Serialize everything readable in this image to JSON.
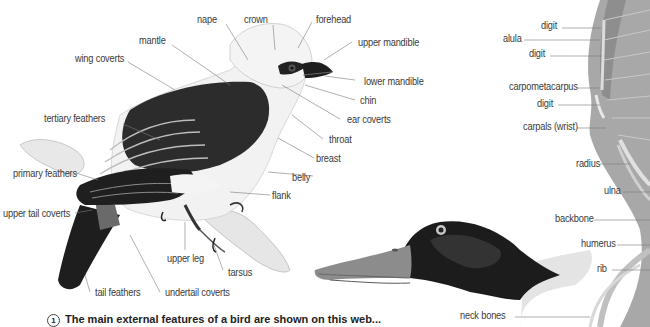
{
  "bird_external": {
    "labels": {
      "nape": "nape",
      "crown": "crown",
      "forehead": "forehead",
      "upper_mandible": "upper mandible",
      "mantle": "mantle",
      "wing_coverts": "wing coverts",
      "lower_mandible": "lower mandible",
      "chin": "chin",
      "ear_coverts": "ear coverts",
      "tertiary_feathers": "tertiary feathers",
      "throat": "throat",
      "breast": "breast",
      "belly": "belly",
      "primary_feathers": "primary feathers",
      "flank": "flank",
      "upper_tail_coverts": "upper tail coverts",
      "upper_leg": "upper leg",
      "tarsus": "tarsus",
      "tail_feathers": "tail feathers",
      "undertail_coverts": "undertail coverts"
    }
  },
  "bird_skeleton": {
    "labels": {
      "digit_1": "digit",
      "alula": "alula",
      "digit_2": "digit",
      "carpometacarpus": "carpometacarpus",
      "digit_3": "digit",
      "carpals": "carpals (wrist)",
      "radius": "radius",
      "ulna": "ulna",
      "backbone": "backbone",
      "humerus": "humerus",
      "rib": "rib",
      "neck_bones": "neck bones"
    }
  },
  "caption": {
    "number": "1",
    "text": "The main external features of a bird are shown on this web..."
  },
  "colors": {
    "ink": "#3a3a3a",
    "dark_plumage": "#2a2a2a",
    "mid_grey": "#8a8a8a",
    "light_grey": "#d8d8d8",
    "duck_bill": "#9a9a9a",
    "wing_grey": "#a8a8a8"
  }
}
